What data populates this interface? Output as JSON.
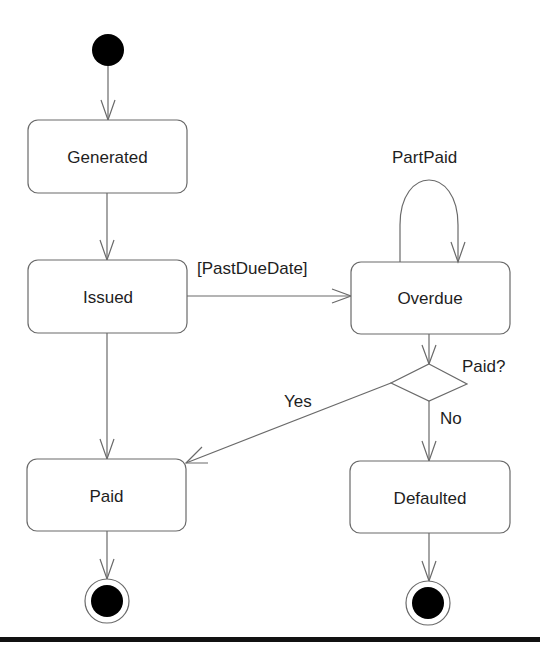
{
  "diagram": {
    "type": "UML state machine",
    "initial_node": {
      "name": "start"
    },
    "states": [
      {
        "id": "generated",
        "label": "Generated"
      },
      {
        "id": "issued",
        "label": "Issued"
      },
      {
        "id": "overdue",
        "label": "Overdue"
      },
      {
        "id": "paid",
        "label": "Paid"
      },
      {
        "id": "defaulted",
        "label": "Defaulted"
      }
    ],
    "decision": {
      "id": "paid-decision",
      "label": "Paid?"
    },
    "transitions": [
      {
        "from": "start",
        "to": "generated",
        "label": ""
      },
      {
        "from": "generated",
        "to": "issued",
        "label": ""
      },
      {
        "from": "issued",
        "to": "overdue",
        "label": "[PastDueDate]"
      },
      {
        "from": "overdue",
        "to": "overdue",
        "label": "PartPaid"
      },
      {
        "from": "issued",
        "to": "paid",
        "label": ""
      },
      {
        "from": "overdue",
        "to": "paid-decision",
        "label": ""
      },
      {
        "from": "paid-decision",
        "to": "paid",
        "label": "Yes"
      },
      {
        "from": "paid-decision",
        "to": "defaulted",
        "label": "No"
      },
      {
        "from": "paid",
        "to": "end-paid",
        "label": ""
      },
      {
        "from": "defaulted",
        "to": "end-defaulted",
        "label": ""
      }
    ],
    "final_nodes": [
      {
        "id": "end-paid"
      },
      {
        "id": "end-defaulted"
      }
    ],
    "colors": {
      "stroke": "#6a6a6a",
      "fill_node": "#000000",
      "text": "#1e1e1e",
      "bottom_rule": "#111111"
    }
  }
}
